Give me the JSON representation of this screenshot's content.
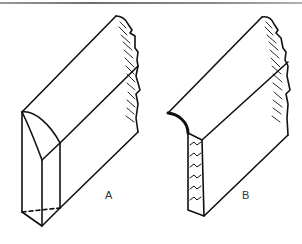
{
  "figure": {
    "type": "technical-line-drawing",
    "stroke_color": "#111111",
    "rule_color": "#7a7a7a",
    "panels": [
      {
        "id": "A",
        "label": "A",
        "edge_profile": "bevelled/chamfered end with dashed hidden bottom edge"
      },
      {
        "id": "B",
        "label": "B",
        "edge_profile": "curved (cove) top edge with hatched cut end grain"
      }
    ]
  }
}
